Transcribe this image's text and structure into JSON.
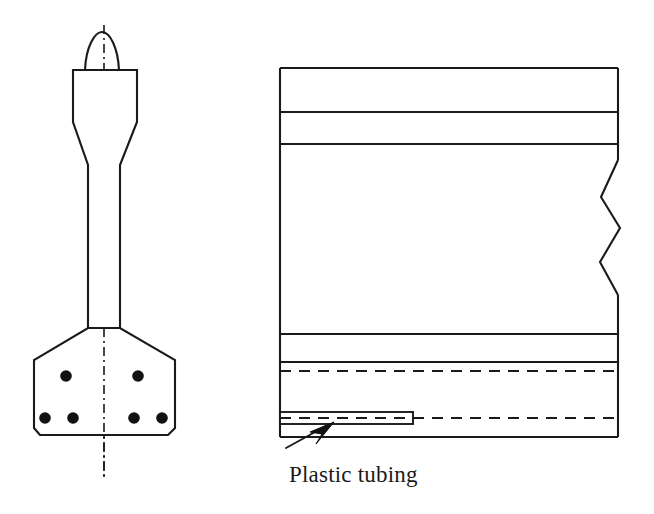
{
  "figure": {
    "background_color": "#ffffff",
    "line_color": "#1a1a1a",
    "fill_color": "#ffffff",
    "annotations": [
      {
        "id": "plastic-tubing",
        "label": "Plastic tubing",
        "x": 289,
        "y": 461
      }
    ],
    "left_view": {
      "name": "anchor-head-elevation",
      "centerline": {
        "x": 104,
        "y_top": 25,
        "y_bottom": 478,
        "style": "dash-dot"
      },
      "arch": {
        "left_x": 85,
        "right_x": 119,
        "apex_x": 102,
        "apex_y": 32,
        "base_y": 70
      },
      "head_outline": "73,70 137,70 137,122 120,165 120,328 88,328 88,165 73,122",
      "base_plate_outline": "88,328 120,328 175,360 175,428 168,435 40,435 34,428 34,360",
      "bolt_holes": [
        {
          "cx": 66,
          "cy": 376,
          "r": 5.8
        },
        {
          "cx": 138,
          "cy": 376,
          "r": 5.8
        },
        {
          "cx": 45,
          "cy": 418,
          "r": 5.8
        },
        {
          "cx": 73,
          "cy": 418,
          "r": 5.8
        },
        {
          "cx": 134,
          "cy": 418,
          "r": 5.8
        },
        {
          "cx": 162,
          "cy": 418,
          "r": 5.8
        }
      ]
    },
    "right_view": {
      "name": "slab-section",
      "left_x": 280,
      "right_x": 618,
      "top_y": 68,
      "bottom_y": 437,
      "solid_horizontal_lines": [
        {
          "y": 68,
          "x1": 280,
          "x2": 618
        },
        {
          "y": 112,
          "x1": 280,
          "x2": 618
        },
        {
          "y": 144,
          "x1": 280,
          "x2": 618
        },
        {
          "y": 334,
          "x1": 280,
          "x2": 618
        },
        {
          "y": 362,
          "x1": 280,
          "x2": 618
        },
        {
          "y": 437,
          "x1": 280,
          "x2": 618
        }
      ],
      "dashed_horizontal_lines": [
        {
          "y": 371,
          "x1": 280,
          "x2": 618
        },
        {
          "y": 418,
          "x1": 413,
          "x2": 618
        }
      ],
      "break_line": {
        "points": "618,160 601,197 620,228 600,262 618,295",
        "style": "zigzag"
      },
      "tubing": {
        "x": 280,
        "y": 412,
        "width": 133,
        "height": 12,
        "centerline_y": 418,
        "centerline_x1": 280,
        "centerline_x2": 413
      },
      "leader_arrow": {
        "tail_x": 286,
        "tail_y": 448,
        "tip_x": 330,
        "tip_y": 424
      }
    }
  }
}
